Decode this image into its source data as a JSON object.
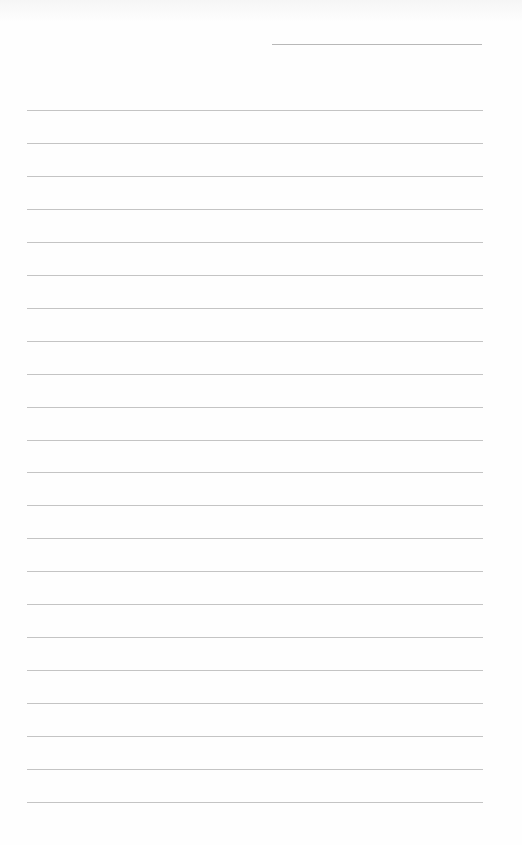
{
  "document": {
    "type": "lined-writing-page",
    "header_field": {
      "label": "",
      "value": ""
    },
    "line_count": 22,
    "line_color": "#c4c4c4",
    "background": "#fefefe",
    "lines": [
      {
        "text": ""
      },
      {
        "text": ""
      },
      {
        "text": ""
      },
      {
        "text": ""
      },
      {
        "text": ""
      },
      {
        "text": ""
      },
      {
        "text": ""
      },
      {
        "text": ""
      },
      {
        "text": ""
      },
      {
        "text": ""
      },
      {
        "text": ""
      },
      {
        "text": ""
      },
      {
        "text": ""
      },
      {
        "text": ""
      },
      {
        "text": ""
      },
      {
        "text": ""
      },
      {
        "text": ""
      },
      {
        "text": ""
      },
      {
        "text": ""
      },
      {
        "text": ""
      },
      {
        "text": ""
      },
      {
        "text": ""
      }
    ]
  }
}
